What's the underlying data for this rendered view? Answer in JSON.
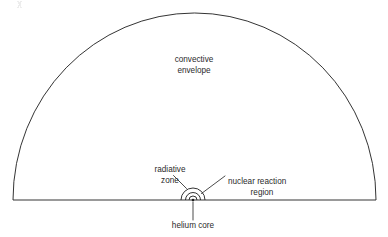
{
  "figure": {
    "kind": "cross-section-diagram",
    "background_color": "#ffffff",
    "line_color": "#1d1d1d",
    "text_color": "#2b2b2b"
  },
  "geometry": {
    "baseline_y": 200,
    "envelope": {
      "center_x": 194.5,
      "left_x": 13,
      "right_x": 376,
      "radius_x": 181.5,
      "radius_y": 187,
      "apex_y": 13
    },
    "core_center": {
      "x": 193,
      "y": 200
    },
    "core_rings": [
      {
        "name": "nuclear-reaction-region",
        "radius": 12.0
      },
      {
        "name": "radiative-zone-inner",
        "radius": 7.5
      },
      {
        "name": "helium-core-shell",
        "radius": 4.0
      }
    ],
    "core_dot_radius": 1.3
  },
  "labels": {
    "convective_envelope": {
      "line1": "convective",
      "line2": "envelope",
      "x": 194,
      "y1": 62,
      "y2": 73
    },
    "radiative_zone": {
      "line1": "radiative",
      "line2": "zone",
      "x": 170,
      "y1": 172,
      "y2": 183
    },
    "nuclear_reaction_region": {
      "line1": "nuclear reaction",
      "line2": "region",
      "x": 228,
      "y1": 184,
      "y2": 195
    },
    "helium_core": {
      "line1": "helium core",
      "x": 193,
      "y1": 228
    }
  },
  "leaders": {
    "radiative_zone": {
      "x1": 173.5,
      "y1": 175.5,
      "x2": 186.5,
      "y2": 188.5
    },
    "nuclear_reaction_region": {
      "x1": 225,
      "y1": 176,
      "x2": 201.5,
      "y2": 193.5
    },
    "helium_core": {
      "x1": 193,
      "y1": 202,
      "x2": 193,
      "y2": 220
    }
  }
}
